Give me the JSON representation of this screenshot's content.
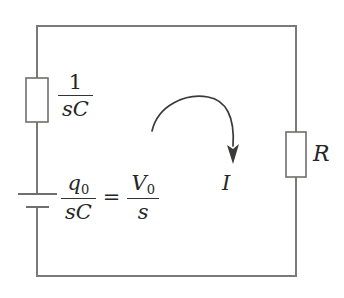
{
  "diagram": {
    "type": "circuit-schematic",
    "colors": {
      "wire": "#7a7a78",
      "component_outline": "#6e6e6c",
      "text": "#262626",
      "arrow": "#3a3a38",
      "background": "#ffffff"
    },
    "labels": {
      "capacitor_impedance": {
        "numerator": "1",
        "denominator_s": "s",
        "denominator_c": "C"
      },
      "source": {
        "left_numerator_q": "q",
        "left_numerator_sub": "0",
        "left_denominator_s": "s",
        "left_denominator_c": "C",
        "equals": "=",
        "right_numerator_v": "V",
        "right_numerator_sub": "0",
        "right_denominator": "s"
      },
      "resistor": "R",
      "current": "I"
    },
    "components": [
      {
        "name": "capacitor-impedance-box",
        "kind": "impedance-block",
        "label": "1/(sC)",
        "position": "left-branch-upper"
      },
      {
        "name": "initial-condition-source",
        "kind": "voltage-source",
        "label": "q0/(sC) = V0/s",
        "position": "left-branch-lower"
      },
      {
        "name": "resistor-box",
        "kind": "resistor",
        "label": "R",
        "position": "right-branch"
      },
      {
        "name": "current-arrow",
        "kind": "current-direction-arrow",
        "label": "I",
        "direction": "clockwise"
      }
    ]
  }
}
